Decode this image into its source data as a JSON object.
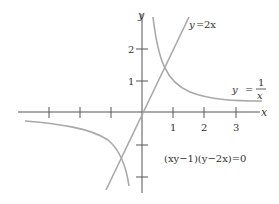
{
  "diagram": {
    "axes": {
      "x_label": "x",
      "y_label": "y",
      "x_tick_labels": [
        "1",
        "2",
        "3"
      ],
      "y_tick_labels": [
        "1",
        "2"
      ]
    },
    "curves": {
      "line_label_lhs": "y",
      "line_label_eq": "=",
      "line_label_rhs": "2x",
      "hyperbola_label_lhs": "y",
      "hyperbola_label_eq": "=",
      "hyperbola_num": "1",
      "hyperbola_den": "x"
    },
    "equation": "(xy−1)(y−2x)=0",
    "colors": {
      "axis": "#555555",
      "curve": "#a8a8a8",
      "text": "#333333"
    }
  }
}
